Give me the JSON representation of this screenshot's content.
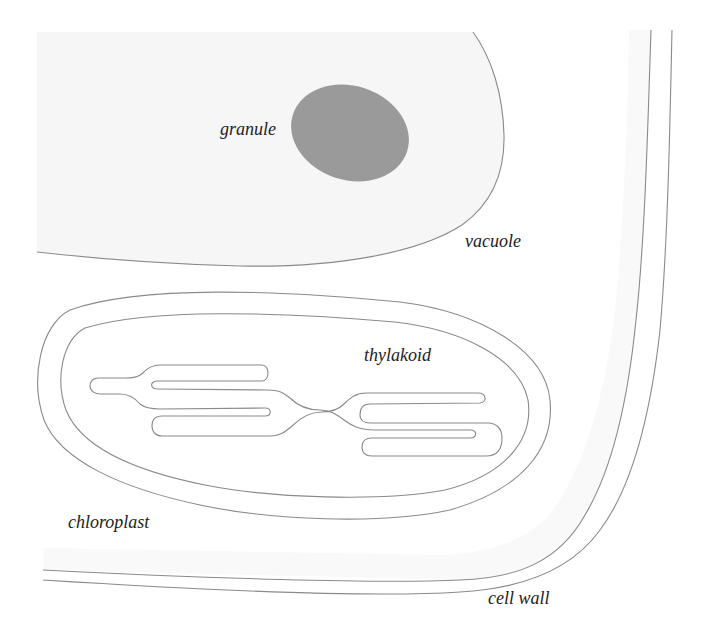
{
  "diagram": {
    "labels": {
      "granule": "granule",
      "vacuole": "vacuole",
      "thylakoid": "thylakoid",
      "chloroplast": "chloroplast",
      "cell_wall": "cell wall"
    },
    "colors": {
      "background": "#ffffff",
      "vacuole_fill": "#f6f6f6",
      "granule_fill": "#9a9a9a",
      "outline": "#8a8a8a",
      "label_text": "#222222"
    }
  }
}
